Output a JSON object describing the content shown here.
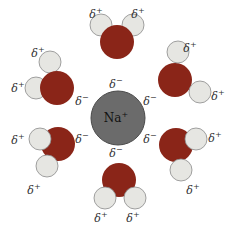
{
  "diagram": {
    "title": "Hydration of sodium ion",
    "colors": {
      "ion_fill": "#6b6b6b",
      "ion_stroke": "#4a4a4a",
      "oxygen_fill": "#8a2518",
      "hydrogen_fill": "#e6e6e2",
      "hydrogen_stroke": "#8a8a8a",
      "text": "#333333"
    },
    "ion": {
      "label": "Na",
      "charge": "+",
      "cx": 118,
      "cy": 118,
      "r": 27
    },
    "partial_negative": "δ⁻",
    "partial_positive": "δ⁺",
    "molecules": [
      {
        "name": "top",
        "o": [
          117,
          42,
          17
        ],
        "h": [
          [
            101,
            25,
            11
          ],
          [
            133,
            25,
            11
          ]
        ],
        "hlabels": [
          [
            96,
            14
          ],
          [
            138,
            14
          ]
        ],
        "olabel": [
          112,
          70
        ]
      },
      {
        "name": "upper-right",
        "o": [
          175,
          80,
          17
        ],
        "h": [
          [
            178,
            52,
            11
          ],
          [
            200,
            92,
            11
          ]
        ],
        "hlabels": [
          [
            190,
            48
          ],
          [
            218,
            96
          ]
        ],
        "olabel": [
          152,
          103
        ]
      },
      {
        "name": "lower-right",
        "o": [
          176,
          145,
          17
        ],
        "h": [
          [
            196,
            139,
            11
          ],
          [
            181,
            170,
            11
          ]
        ],
        "hlabels": [
          [
            215,
            138
          ],
          [
            193,
            190
          ]
        ],
        "olabel": [
          154,
          135
        ]
      },
      {
        "name": "bottom",
        "o": [
          119,
          180,
          17
        ],
        "h": [
          [
            105,
            198,
            11
          ],
          [
            135,
            198,
            11
          ]
        ],
        "hlabels": [
          [
            101,
            218
          ],
          [
            133,
            218
          ]
        ],
        "olabel": [
          113,
          162
        ]
      },
      {
        "name": "lower-left",
        "o": [
          58,
          144,
          17
        ],
        "h": [
          [
            40,
            139,
            11
          ],
          [
            47,
            166,
            11
          ]
        ],
        "hlabels": [
          [
            18,
            140
          ],
          [
            34,
            190
          ]
        ],
        "olabel": [
          80,
          134
        ]
      },
      {
        "name": "upper-left",
        "o": [
          57,
          88,
          17
        ],
        "h": [
          [
            50,
            62,
            11
          ],
          [
            36,
            88,
            11
          ]
        ],
        "hlabels": [
          [
            38,
            53
          ],
          [
            18,
            88
          ]
        ],
        "olabel": [
          80,
          104
        ]
      }
    ],
    "extra_neg_labels": [
      [
        80,
        100
      ],
      [
        154,
        100
      ]
    ]
  }
}
